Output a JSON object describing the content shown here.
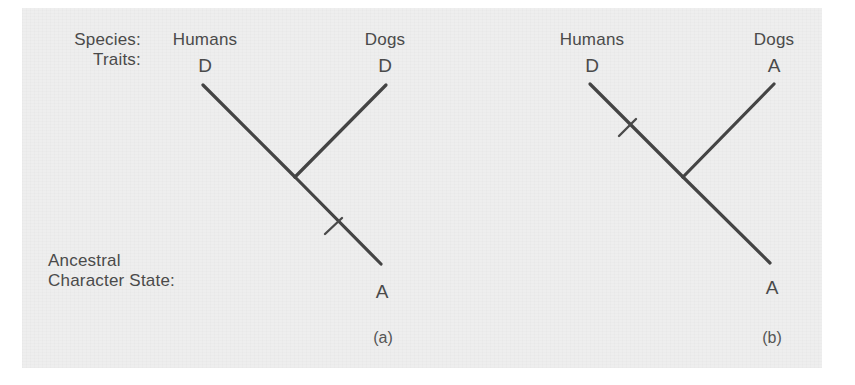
{
  "figure": {
    "background_color": "#eeeeee",
    "line_color": "#444444",
    "text_color": "#4a4a4a"
  },
  "row_labels": {
    "species": "Species:",
    "traits": "Traits:",
    "ancestral_line1": "Ancestral",
    "ancestral_line2": "Character State:"
  },
  "trees": [
    {
      "caption": "(a)",
      "taxa": [
        {
          "name": "Humans",
          "trait": "D"
        },
        {
          "name": "Dogs",
          "trait": "D"
        }
      ],
      "ancestral_state": "A",
      "change_mark_on": "root-branch",
      "change_mark_count": 1
    },
    {
      "caption": "(b)",
      "taxa": [
        {
          "name": "Humans",
          "trait": "D"
        },
        {
          "name": "Dogs",
          "trait": "A"
        }
      ],
      "ancestral_state": "A",
      "change_mark_on": "humans-branch",
      "change_mark_count": 1
    }
  ]
}
